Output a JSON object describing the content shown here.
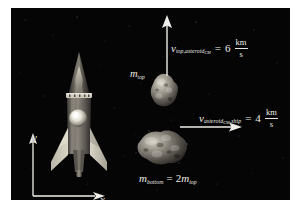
{
  "figure": {
    "name": "asteroid-rocket-velocity-diagram",
    "background_color": "#ffffff",
    "panel_color": "#050505",
    "text_color": "#f0efe9"
  },
  "objects": {
    "rocket": {
      "name": "rocket-ship",
      "label": "ship"
    },
    "asteroid_top": {
      "name": "asteroid-top-fragment"
    },
    "asteroid_bottom": {
      "name": "asteroid-bottom-fragment"
    }
  },
  "labels": {
    "m_top": {
      "symbol": "m",
      "subscript": "top"
    },
    "m_bottom": {
      "symbol": "m",
      "subscript": "bottom",
      "equals": "=",
      "coefficient": "2",
      "rhs_symbol": "m",
      "rhs_subscript": "top"
    },
    "axis_x": "x",
    "axis_y": "y"
  },
  "vectors": {
    "v_top_relative_cm": {
      "symbol": "v",
      "subscript_main": "top,asteroid",
      "subscript_sub": "CM",
      "equals": "=",
      "value": "6",
      "unit_numerator": "km",
      "unit_denominator": "s",
      "direction": "up"
    },
    "v_cm_relative_ship": {
      "symbol": "v",
      "subscript_main": "asteroid",
      "subscript_sub": "CM",
      "subscript_tail": ",ship",
      "equals": "=",
      "value": "4",
      "unit_numerator": "km",
      "unit_denominator": "s",
      "direction": "right"
    }
  }
}
